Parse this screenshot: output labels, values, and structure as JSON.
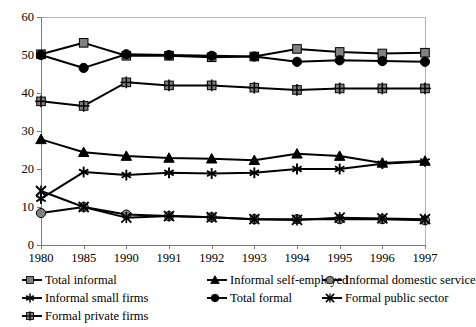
{
  "chart_data": {
    "type": "line",
    "title": "",
    "xlabel": "",
    "ylabel": "",
    "categories": [
      "1980",
      "1985",
      "1990",
      "1991",
      "1992",
      "1993",
      "1994",
      "1995",
      "1996",
      "1997"
    ],
    "ylim": [
      0,
      60
    ],
    "ytick_values": [
      0,
      10,
      20,
      30,
      40,
      50,
      60
    ],
    "ytick_labels": [
      "0",
      "10",
      "20",
      "30",
      "40",
      "50",
      "60"
    ],
    "grid": false,
    "legend_position": "bottom",
    "series": [
      {
        "name": "Total informal",
        "marker": "square",
        "color": "#808080",
        "line_color": "#000000",
        "values": [
          50.2,
          53.2,
          49.8,
          49.8,
          49.4,
          49.6,
          51.6,
          50.8,
          50.4,
          50.6
        ]
      },
      {
        "name": "Informal self-employed",
        "marker": "triangle",
        "color": "#000000",
        "line_color": "#000000",
        "values": [
          27.8,
          24.4,
          23.4,
          22.9,
          22.7,
          22.3,
          24.0,
          23.4,
          21.6,
          22.1
        ]
      },
      {
        "name": "Informal domestic service",
        "marker": "circle",
        "color": "#808080",
        "line_color": "#000000",
        "values": [
          8.4,
          10.0,
          8.0,
          7.6,
          7.3,
          6.8,
          6.8,
          6.8,
          6.8,
          6.5
        ]
      },
      {
        "name": "Informal small firms",
        "marker": "asterisk",
        "color": "#000000",
        "line_color": "#000000",
        "values": [
          12.2,
          19.2,
          18.4,
          19.0,
          18.8,
          19.0,
          20.0,
          20.0,
          21.4,
          22.0
        ]
      },
      {
        "name": "Total formal",
        "marker": "circle-filled",
        "color": "#000000",
        "line_color": "#000000",
        "values": [
          50.0,
          46.6,
          50.2,
          50.0,
          49.8,
          49.6,
          48.2,
          48.6,
          48.4,
          48.2
        ]
      },
      {
        "name": "Formal public sector",
        "marker": "x-cross",
        "color": "#000000",
        "line_color": "#000000",
        "values": [
          14.2,
          10.0,
          7.2,
          7.6,
          7.3,
          6.8,
          6.6,
          7.2,
          7.0,
          6.8
        ]
      },
      {
        "name": "Formal private firms",
        "marker": "square-cross",
        "color": "#808080",
        "line_color": "#000000",
        "values": [
          37.8,
          36.6,
          42.8,
          42.0,
          42.0,
          41.4,
          40.8,
          41.2,
          41.2,
          41.2
        ]
      }
    ]
  },
  "legend": {
    "items": [
      {
        "label": "Total informal",
        "marker": "square",
        "col": 0,
        "row": 0
      },
      {
        "label": "Informal self-employed",
        "marker": "triangle",
        "col": 1,
        "row": 0
      },
      {
        "label": "Informal domestic service",
        "marker": "circle",
        "col": 2,
        "row": 0
      },
      {
        "label": "Informal small firms",
        "marker": "asterisk",
        "col": 0,
        "row": 1
      },
      {
        "label": "Total formal",
        "marker": "circle-filled",
        "col": 1,
        "row": 1
      },
      {
        "label": "Formal public sector",
        "marker": "x-cross",
        "col": 2,
        "row": 1
      },
      {
        "label": "Formal private firms",
        "marker": "square-cross",
        "col": 0,
        "row": 2
      }
    ]
  }
}
